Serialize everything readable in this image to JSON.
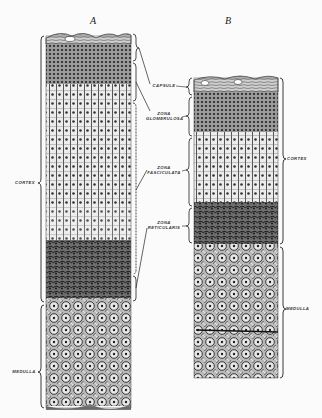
{
  "figure": {
    "panels": [
      {
        "letter": "A"
      },
      {
        "letter": "B"
      }
    ],
    "labels": {
      "capsule": "CAPSULE",
      "zona_glomerulosa_1": "ZONA",
      "zona_glomerulosa_2": "GLOMERULOSA",
      "zona_fasciculata_1": "ZONA",
      "zona_fasciculata_2": "FASCICULATA",
      "zona_reticularis_1": "ZONA",
      "zona_reticularis_2": "RETICULARIS",
      "cortex_left": "CORTEX",
      "medulla_left": "MEDULLA",
      "cortex_right": "CORTEX",
      "medulla_right": "MEDULLA"
    },
    "colors": {
      "background": "#fbfbfb",
      "ink": "#222222",
      "tissue_dark": "#3a3a3a",
      "tissue_light": "#d8d8d8"
    }
  }
}
